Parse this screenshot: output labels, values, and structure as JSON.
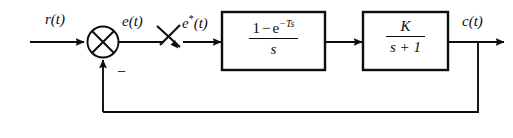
{
  "diagram": {
    "type": "control-system-block-diagram",
    "background_color": "#ffffff",
    "line_color": "#0d0d0d",
    "signals": {
      "input": "r(t)",
      "error": "e(t)",
      "sampled_error_base": "e",
      "sampled_error_star": "*",
      "sampled_error_arg": "(t)",
      "output": "c(t)",
      "feedback_sign": "−"
    },
    "blocks": [
      {
        "name": "zero-order-hold",
        "numerator_lead": "1",
        "numerator_op": "−",
        "numerator_base": "e",
        "numerator_exponent": "−Ts",
        "denominator": "s"
      },
      {
        "name": "plant",
        "numerator": "K",
        "denominator": "s + 1"
      }
    ],
    "elements": {
      "summing_junction": "crossed-circle-summing-junction",
      "sampler": "sampler-switch",
      "feedback_path": "unity-feedback-line"
    },
    "caption": ""
  }
}
